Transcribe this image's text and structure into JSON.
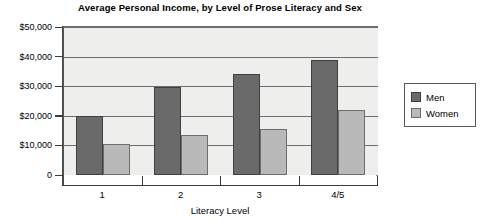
{
  "chart_data": {
    "type": "bar",
    "title": "Average Personal Income, by Level of Prose Literacy and Sex",
    "xlabel": "Literacy Level",
    "ylabel": "",
    "categories": [
      "1",
      "2",
      "3",
      "4/5"
    ],
    "series": [
      {
        "name": "Men",
        "color": "#6a6a6a",
        "values": [
          19800,
          29700,
          34200,
          38800
        ]
      },
      {
        "name": "Women",
        "color": "#b9b9b9",
        "values": [
          10600,
          13600,
          15600,
          21800
        ]
      }
    ],
    "ylim": [
      0,
      50000
    ],
    "ytick_values": [
      50000,
      40000,
      30000,
      20000,
      10000,
      0
    ],
    "ytick_labels": [
      "$50,000",
      "$40,000",
      "$30,000",
      "$20,000",
      "$10,000",
      "0"
    ],
    "grid": true,
    "legend_position": "right",
    "legend_entries": [
      "Men",
      "Women"
    ]
  }
}
